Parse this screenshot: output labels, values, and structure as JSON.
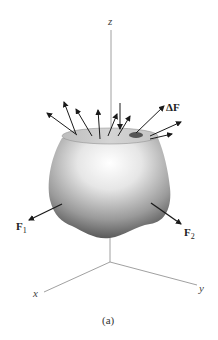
{
  "figure": {
    "caption": "(a)",
    "axes": {
      "z_label": "z",
      "x_label": "x",
      "y_label": "y"
    },
    "forces": {
      "delta_f": {
        "prefix": "Δ",
        "symbol": "F"
      },
      "f1": {
        "symbol": "F",
        "subscript": "1"
      },
      "f2": {
        "symbol": "F",
        "subscript": "2"
      }
    },
    "colors": {
      "axis": "#888888",
      "arrow": "#1a1a1a",
      "body_light": "#ffffff",
      "body_dark": "#5a5a5a",
      "top_face": "#c8c8c8",
      "patch": "#555555"
    }
  }
}
